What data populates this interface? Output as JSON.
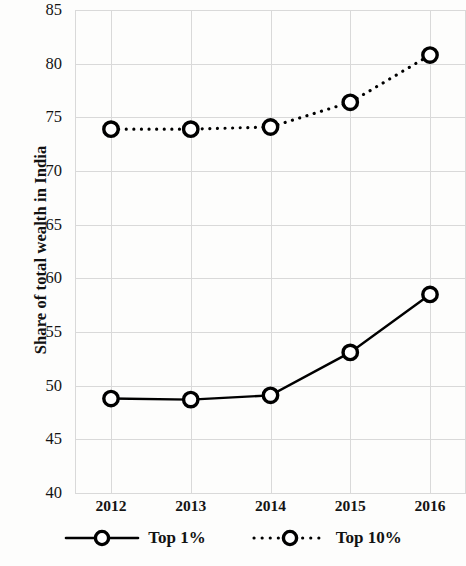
{
  "chart_data": {
    "type": "line",
    "title": "",
    "subtitle": "",
    "xlabel": "",
    "ylabel": "Share of total wealth in India",
    "categories": [
      "2012",
      "2013",
      "2014",
      "2015",
      "2016"
    ],
    "x": [
      2012,
      2013,
      2014,
      2015,
      2016
    ],
    "series": [
      {
        "name": "Top 1%",
        "values": [
          48.8,
          48.7,
          49.1,
          53.1,
          58.5
        ],
        "linestyle": "solid",
        "marker": "open-circle",
        "color": "#000000"
      },
      {
        "name": "Top 10%",
        "values": [
          73.9,
          73.9,
          74.1,
          76.4,
          80.8
        ],
        "linestyle": "dotted",
        "marker": "open-circle",
        "color": "#000000"
      }
    ],
    "ylim": [
      40,
      85
    ],
    "ytick_labels": [
      "40",
      "45",
      "50",
      "55",
      "60",
      "65",
      "70",
      "75",
      "80",
      "85"
    ],
    "ytick_values": [
      40,
      45,
      50,
      55,
      60,
      65,
      70,
      75,
      80,
      85
    ],
    "xtick_labels": [
      "2012",
      "2013",
      "2014",
      "2015",
      "2016"
    ],
    "grid": true,
    "grid_color": "#d9d9d9",
    "legend_position": "bottom",
    "legend_entries": [
      "Top 1%",
      "Top 10%"
    ],
    "background_color": "#fdfdfc"
  },
  "legend": {
    "items": [
      {
        "label": "Top 1%",
        "style": "solid"
      },
      {
        "label": "Top 10%",
        "style": "dotted"
      }
    ]
  }
}
